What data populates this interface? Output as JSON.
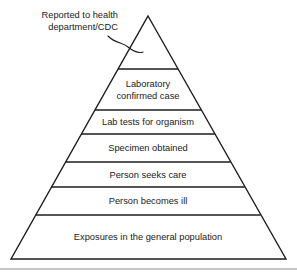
{
  "figure": {
    "background_color": "#ffffff",
    "line_color": "#1d1d1d",
    "text_color": "#1a1a1a",
    "rule_color": "#8c8c8c"
  },
  "annotation": {
    "line1": "Reported to health",
    "line2": "department/CDC",
    "leader_icon": "curved-leader-line-icon"
  },
  "chart_data": {
    "type": "pyramid",
    "orientation": "apex-up",
    "tier_count": 7,
    "tiers": [
      {
        "index": 0,
        "label": "",
        "label_lines": [],
        "note": "unlabeled apex tier annotated as reported to health department/CDC"
      },
      {
        "index": 1,
        "label": "Laboratory confirmed case",
        "label_lines": [
          "Laboratory",
          "confirmed case"
        ]
      },
      {
        "index": 2,
        "label": "Lab tests for organism",
        "label_lines": [
          "Lab tests for organism"
        ]
      },
      {
        "index": 3,
        "label": "Specimen obtained",
        "label_lines": [
          "Specimen obtained"
        ]
      },
      {
        "index": 4,
        "label": "Person seeks care",
        "label_lines": [
          "Person seeks care"
        ]
      },
      {
        "index": 5,
        "label": "Person becomes ill",
        "label_lines": [
          "Person becomes ill"
        ]
      },
      {
        "index": 6,
        "label": "Exposures in the general population",
        "label_lines": [
          "Exposures in the general population"
        ]
      }
    ],
    "annotations": [
      {
        "text": "Reported to health department/CDC",
        "points_to_tier": 0
      }
    ]
  },
  "geometry": {
    "apex_x": 148,
    "apex_y": 16,
    "base_left_x": 11,
    "base_right_x": 286,
    "base_y": 259,
    "divider_y": [
      69,
      110,
      134,
      162,
      187,
      215
    ],
    "footer_rule_y": 269
  }
}
